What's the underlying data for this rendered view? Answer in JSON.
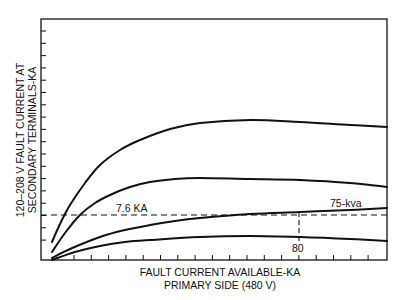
{
  "chart_data": {
    "type": "line",
    "title": "",
    "xlabel": "FAULT CURRENT AVAILABLE-KA\nPRIMARY SIDE (480 V)",
    "xlabel_lines": [
      "FAULT CURRENT AVAILABLE-KA",
      "PRIMARY SIDE (480 V)"
    ],
    "ylabel": "120-208 V FAULT CURRENT AT\nSECONDARY TERMINALS-KA",
    "ylabel_lines": [
      "120–208 V FAULT CURRENT AT",
      "SECONDARY TERMINALS-KA"
    ],
    "x_tick_labels": [],
    "y_tick_labels": [],
    "x_tick_count": 18,
    "y_tick_count": 18,
    "grid": false,
    "legend": null,
    "series": [
      {
        "name": "curve-1 (largest kva)",
        "points_px": [
          [
            52,
            242
          ],
          [
            60,
            224
          ],
          [
            70,
            205
          ],
          [
            85,
            183
          ],
          [
            100,
            165
          ],
          [
            120,
            150
          ],
          [
            140,
            140
          ],
          [
            170,
            129
          ],
          [
            200,
            123
          ],
          [
            250,
            120
          ],
          [
            300,
            122
          ],
          [
            350,
            125
          ],
          [
            387,
            127
          ]
        ]
      },
      {
        "name": "curve-2",
        "points_px": [
          [
            52,
            252
          ],
          [
            65,
            233
          ],
          [
            80,
            215
          ],
          [
            95,
            203
          ],
          [
            110,
            195
          ],
          [
            130,
            187
          ],
          [
            150,
            182
          ],
          [
            175,
            179
          ],
          [
            200,
            178
          ],
          [
            250,
            179
          ],
          [
            300,
            180
          ],
          [
            350,
            183
          ],
          [
            387,
            187
          ]
        ]
      },
      {
        "name": "75-kva",
        "points_px": [
          [
            52,
            258
          ],
          [
            70,
            249
          ],
          [
            100,
            237
          ],
          [
            125,
            230
          ],
          [
            150,
            225
          ],
          [
            175,
            221
          ],
          [
            200,
            218
          ],
          [
            250,
            214
          ],
          [
            300,
            212
          ],
          [
            350,
            210
          ],
          [
            387,
            208
          ]
        ]
      },
      {
        "name": "curve-4 (smallest kva)",
        "points_px": [
          [
            52,
            260
          ],
          [
            75,
            252
          ],
          [
            100,
            246
          ],
          [
            125,
            242
          ],
          [
            150,
            240
          ],
          [
            200,
            237
          ],
          [
            250,
            236
          ],
          [
            300,
            237
          ],
          [
            350,
            239
          ],
          [
            387,
            241
          ]
        ]
      }
    ],
    "annotations": [
      {
        "text": "7.6 KA",
        "type": "horizontal-reference",
        "y_px": 215
      },
      {
        "text": "75-kva",
        "type": "curve-label"
      },
      {
        "text": "80",
        "type": "vertical-reference",
        "x_px": 299
      }
    ],
    "plot_frame_px": {
      "left": 41,
      "top": 19,
      "right": 387,
      "bottom": 260
    }
  },
  "labels": {
    "ylabel_line1": "120–208 V FAULT CURRENT AT",
    "ylabel_line2": "SECONDARY TERMINALS-KA",
    "xlabel_line1": "FAULT CURRENT AVAILABLE-KA",
    "xlabel_line2": "PRIMARY SIDE (480 V)",
    "ref_current": "7.6 KA",
    "curve_label": "75-kva",
    "ref_x_value": "80"
  },
  "colors": {
    "ink": "#111111",
    "background": "#ffffff"
  }
}
